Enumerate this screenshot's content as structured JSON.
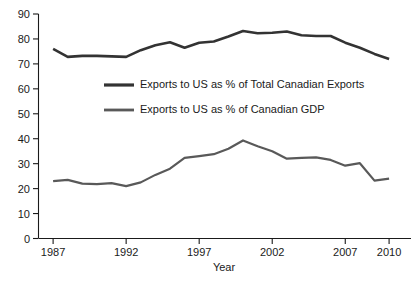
{
  "chart_data": {
    "type": "line",
    "title": "",
    "xlabel": "Year",
    "ylabel": "",
    "xlim": [
      1986,
      2011.5
    ],
    "ylim": [
      0,
      90
    ],
    "grid": false,
    "legend_position": "inside-upper-center",
    "x": [
      1987,
      1988,
      1989,
      1990,
      1991,
      1992,
      1993,
      1994,
      1995,
      1996,
      1997,
      1998,
      1999,
      2000,
      2001,
      2002,
      2003,
      2004,
      2005,
      2006,
      2007,
      2008,
      2009,
      2010
    ],
    "x_ticks": [
      1987,
      1992,
      1997,
      2002,
      2007,
      2010
    ],
    "x_tick_labels": [
      "1987",
      "1992",
      "1997",
      "2002",
      "2007",
      "2010"
    ],
    "y_ticks": [
      0,
      10,
      20,
      30,
      40,
      50,
      60,
      70,
      80,
      90
    ],
    "y_tick_labels": [
      "0",
      "10",
      "20",
      "30",
      "40",
      "50",
      "60",
      "70",
      "80",
      "90"
    ],
    "series": [
      {
        "name": "Exports to US as % of Total Canadian Exports",
        "color": "#333333",
        "width": 2.6,
        "values": [
          76.0,
          72.8,
          73.2,
          73.2,
          73.0,
          72.8,
          75.5,
          77.5,
          78.7,
          76.5,
          78.5,
          79.0,
          81.0,
          83.2,
          82.3,
          82.5,
          83.0,
          81.5,
          81.2,
          81.2,
          78.5,
          76.5,
          74.0,
          72.0
        ]
      },
      {
        "name": "Exports to US as % of Canadian GDP",
        "color": "#595959",
        "width": 2.2,
        "values": [
          23.0,
          23.5,
          22.0,
          21.8,
          22.2,
          21.0,
          22.5,
          25.5,
          28.0,
          32.3,
          33.0,
          33.8,
          36.0,
          39.3,
          37.0,
          35.0,
          32.0,
          32.3,
          32.5,
          31.5,
          29.2,
          30.2,
          23.2,
          24.0
        ]
      }
    ]
  },
  "legend": {
    "items": [
      {
        "label": "Exports to US as % of Total Canadian Exports"
      },
      {
        "label": "Exports to US as % of Canadian GDP"
      }
    ]
  },
  "axis": {
    "x_title": "Year"
  }
}
